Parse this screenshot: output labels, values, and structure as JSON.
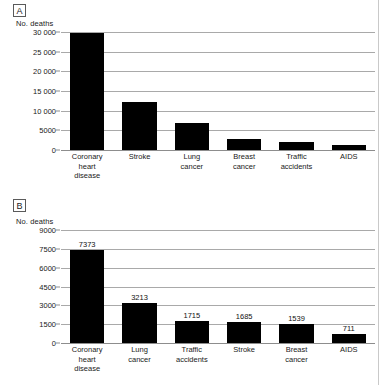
{
  "figure": {
    "background_color": "#ffffff",
    "bar_color": "#000000",
    "grid_color": "#a9a9a9",
    "axis_title": "No. deaths"
  },
  "panels": {
    "a": {
      "tag": "A",
      "axis_title": "No. deaths"
    },
    "b": {
      "tag": "B",
      "axis_title": "No. deaths"
    }
  },
  "chart_data": [
    {
      "type": "bar",
      "panel": "A",
      "title": "",
      "xlabel": "",
      "ylabel": "No. deaths",
      "ylim": [
        0,
        30000
      ],
      "grid": true,
      "legend": "none",
      "yticks": [
        0,
        5000,
        10000,
        15000,
        20000,
        25000,
        30000
      ],
      "ytick_labels": [
        "0",
        "5000",
        "10 000",
        "15 000",
        "20 000",
        "25 000",
        "30 000"
      ],
      "categories": [
        "Coronary heart disease",
        "Stroke",
        "Lung cancer",
        "Breast cancer",
        "Traffic accidents",
        "AIDS"
      ],
      "category_lines": [
        [
          "Coronary",
          "heart",
          "disease"
        ],
        [
          "Stroke"
        ],
        [
          "Lung",
          "cancer"
        ],
        [
          "Breast",
          "cancer"
        ],
        [
          "Traffic",
          "accidents"
        ],
        [
          "AIDS"
        ]
      ],
      "values": [
        29700,
        12300,
        6800,
        2850,
        2050,
        1150
      ],
      "value_labels_shown": false
    },
    {
      "type": "bar",
      "panel": "B",
      "title": "",
      "xlabel": "",
      "ylabel": "No. deaths",
      "ylim": [
        0,
        9000
      ],
      "grid": true,
      "legend": "none",
      "yticks": [
        0,
        1500,
        3000,
        4500,
        6000,
        7500,
        9000
      ],
      "ytick_labels": [
        "0",
        "1500",
        "3000",
        "4500",
        "6000",
        "7500",
        "9000"
      ],
      "categories": [
        "Coronary heart disease",
        "Lung cancer",
        "Traffic accidents",
        "Stroke",
        "Breast cancer",
        "AIDS"
      ],
      "category_lines": [
        [
          "Coronary",
          "heart",
          "disease"
        ],
        [
          "Lung",
          "cancer"
        ],
        [
          "Traffic",
          "accidents"
        ],
        [
          "Stroke"
        ],
        [
          "Breast",
          "cancer"
        ],
        [
          "AIDS"
        ]
      ],
      "values": [
        7373,
        3213,
        1715,
        1685,
        1539,
        711
      ],
      "value_labels": [
        "7373",
        "3213",
        "1715",
        "1685",
        "1539",
        "711"
      ],
      "value_labels_shown": true
    }
  ]
}
